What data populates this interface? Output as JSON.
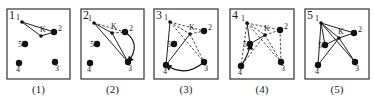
{
  "figure": {
    "panels": [
      {
        "number": "1",
        "caption": "(1)",
        "box": [
          7,
          9,
          63,
          70
        ],
        "points": {
          "1": [
            22,
            22
          ],
          "2": [
            54,
            32
          ],
          "3": [
            55,
            62
          ],
          "4": [
            19,
            63
          ],
          "5": [
            25,
            44
          ],
          "K": [
            41,
            36
          ]
        },
        "solid": [
          [
            "1",
            "2"
          ],
          [
            "1",
            "K"
          ],
          [
            "K",
            "2"
          ]
        ],
        "dashed": [],
        "arrow": null
      },
      {
        "number": "2",
        "caption": "(2)",
        "box": [
          81,
          9,
          63,
          70
        ],
        "points": {
          "1": [
            94,
            23
          ],
          "2": [
            125,
            32
          ],
          "3": [
            128,
            62
          ],
          "4": [
            90,
            63
          ],
          "5": [
            97,
            44
          ],
          "K": [
            112,
            33
          ]
        },
        "solid": [
          [
            "1",
            "3"
          ],
          [
            "1",
            "K"
          ],
          [
            "K",
            "3"
          ]
        ],
        "dashed": [
          [
            "1",
            "2"
          ],
          [
            "K",
            "2"
          ]
        ],
        "arrow": {
          "from": "2",
          "to": "3",
          "ctrl": [
            142,
            44
          ]
        }
      },
      {
        "number": "3",
        "caption": "(3)",
        "box": [
          154,
          9,
          64,
          70
        ],
        "points": {
          "1": [
            170,
            22
          ],
          "2": [
            204,
            31
          ],
          "3": [
            204,
            62
          ],
          "4": [
            166,
            65
          ],
          "5": [
            174,
            44
          ],
          "K": [
            190,
            34
          ]
        },
        "solid": [
          [
            "1",
            "4"
          ],
          [
            "4",
            "K"
          ]
        ],
        "dashed": [
          [
            "1",
            "2"
          ],
          [
            "K",
            "2"
          ],
          [
            "1",
            "3"
          ],
          [
            "K",
            "3"
          ],
          [
            "1",
            "K"
          ]
        ],
        "arrow": {
          "from": "3",
          "to": "4",
          "ctrl": [
            186,
            78
          ]
        }
      },
      {
        "number": "4",
        "caption": "(4)",
        "box": [
          230,
          9,
          64,
          70
        ],
        "points": {
          "1": [
            247,
            23
          ],
          "2": [
            280,
            30
          ],
          "3": [
            281,
            62
          ],
          "4": [
            241,
            66
          ],
          "5": [
            250,
            44
          ],
          "K": [
            265,
            35
          ]
        },
        "solid": [
          [
            "1",
            "5"
          ],
          [
            "5",
            "K"
          ]
        ],
        "dashed": [
          [
            "1",
            "2"
          ],
          [
            "K",
            "2"
          ],
          [
            "1",
            "3"
          ],
          [
            "K",
            "3"
          ],
          [
            "1",
            "K"
          ],
          [
            "2",
            "3"
          ],
          [
            "1",
            "4"
          ],
          [
            "K",
            "4"
          ]
        ],
        "arrow": {
          "from": "4",
          "to": "5",
          "ctrl": [
            250,
            52
          ]
        }
      },
      {
        "number": "5",
        "caption": "(5)",
        "box": [
          305,
          9,
          64,
          70
        ],
        "points": {
          "1": [
            321,
            23
          ],
          "2": [
            354,
            33
          ],
          "3": [
            355,
            62
          ],
          "4": [
            318,
            65
          ],
          "5": [
            325,
            45
          ],
          "K": [
            339,
            38
          ]
        },
        "solid": [
          [
            "1",
            "2"
          ],
          [
            "1",
            "K"
          ],
          [
            "K",
            "2"
          ],
          [
            "1",
            "3"
          ],
          [
            "K",
            "3"
          ],
          [
            "1",
            "4"
          ],
          [
            "K",
            "4"
          ],
          [
            "1",
            "5"
          ],
          [
            "5",
            "K"
          ]
        ],
        "dashed": [],
        "arrow": null
      }
    ],
    "point_labels": [
      "1",
      "2",
      "3",
      "4",
      "5",
      "K"
    ]
  }
}
